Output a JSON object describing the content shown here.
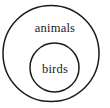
{
  "diagram": {
    "type": "euler-diagram",
    "background_color": "#ffffff",
    "stroke_color": "#1a1a1a",
    "text_color": "#1a1a1a",
    "sets": [
      {
        "id": "animals",
        "label": "animals",
        "role": "outer-set",
        "center_x": 51,
        "center_y": 53.5,
        "radius": 48,
        "stroke_width": 1.5,
        "label_x": 55,
        "label_y": 28,
        "font_size": 12.5
      },
      {
        "id": "birds",
        "label": "birds",
        "role": "inner-set",
        "center_x": 54.5,
        "center_y": 67.5,
        "radius": 24.5,
        "stroke_width": 1.5,
        "label_x": 55,
        "label_y": 69,
        "font_size": 12.5
      }
    ]
  }
}
